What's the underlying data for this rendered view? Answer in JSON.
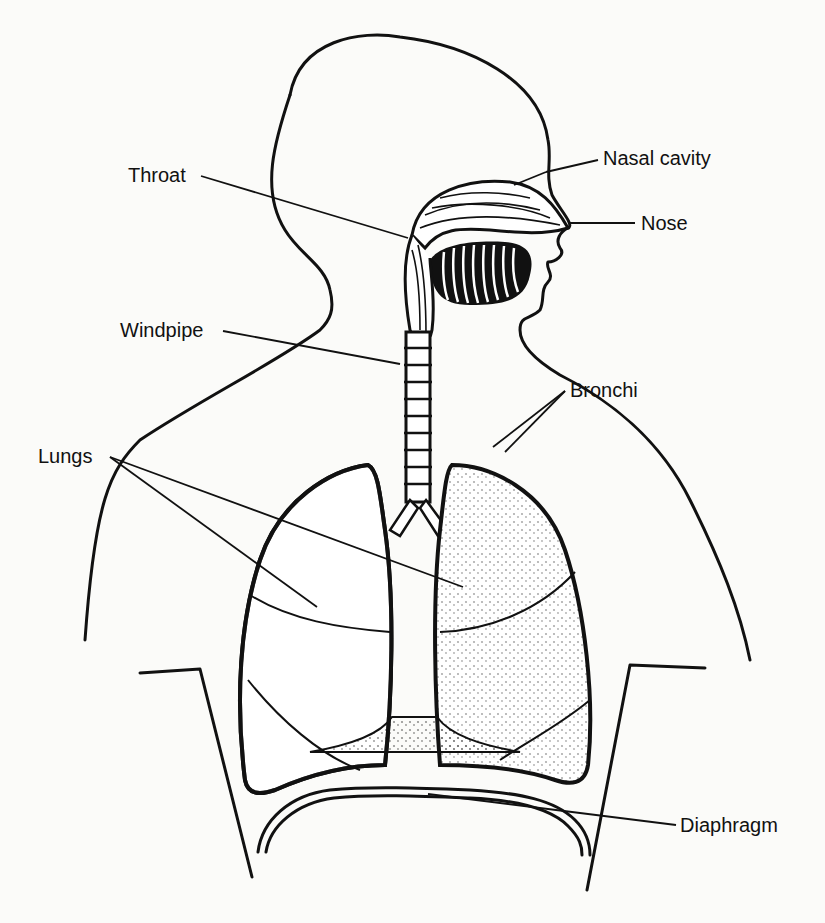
{
  "diagram": {
    "labels": {
      "nasal_cavity": "Nasal cavity",
      "throat": "Throat",
      "nose": "Nose",
      "windpipe": "Windpipe",
      "bronchi": "Bronchi",
      "lungs": "Lungs",
      "diaphragm": "Diaphragm"
    },
    "colors": {
      "ink": "#111111",
      "paper": "#fbfbf9"
    }
  }
}
